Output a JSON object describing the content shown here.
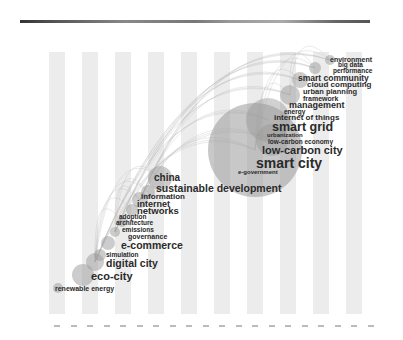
{
  "view": {
    "type": "keyword co-occurrence timezone map",
    "background": "#ffffff",
    "stripe_color": "#ececec",
    "node_color": "#9a9a9a",
    "link_color": "#b5b5b5",
    "text_color": "#2a2a2a"
  },
  "header": {
    "colorbar": {
      "colors": [
        "#333333",
        "#888888",
        "#777777",
        "#aaaaaa",
        "#555555"
      ]
    },
    "meta_lines": [
      "",
      "",
      "",
      "",
      "",
      "",
      ""
    ]
  },
  "timeline": {
    "slice_count": 20,
    "first_stripe_x": 49,
    "stripe_pitch": 33,
    "stripe_width": 16
  },
  "nodes": [
    {
      "cx": 255,
      "cy": 150,
      "r": 47,
      "opacity": 0.55
    },
    {
      "cx": 268,
      "cy": 120,
      "r": 22,
      "opacity": 0.45
    },
    {
      "cx": 272,
      "cy": 140,
      "r": 16,
      "opacity": 0.45
    },
    {
      "cx": 290,
      "cy": 95,
      "r": 10,
      "opacity": 0.5
    },
    {
      "cx": 300,
      "cy": 80,
      "r": 8,
      "opacity": 0.5
    },
    {
      "cx": 315,
      "cy": 68,
      "r": 6,
      "opacity": 0.5
    },
    {
      "cx": 330,
      "cy": 60,
      "r": 5,
      "opacity": 0.5
    },
    {
      "cx": 160,
      "cy": 178,
      "r": 12,
      "opacity": 0.5
    },
    {
      "cx": 148,
      "cy": 192,
      "r": 7,
      "opacity": 0.5
    },
    {
      "cx": 140,
      "cy": 200,
      "r": 8,
      "opacity": 0.5
    },
    {
      "cx": 132,
      "cy": 210,
      "r": 6,
      "opacity": 0.5
    },
    {
      "cx": 122,
      "cy": 222,
      "r": 5,
      "opacity": 0.5
    },
    {
      "cx": 115,
      "cy": 232,
      "r": 5,
      "opacity": 0.5
    },
    {
      "cx": 108,
      "cy": 243,
      "r": 7,
      "opacity": 0.5
    },
    {
      "cx": 100,
      "cy": 255,
      "r": 6,
      "opacity": 0.5
    },
    {
      "cx": 95,
      "cy": 262,
      "r": 9,
      "opacity": 0.5
    },
    {
      "cx": 83,
      "cy": 275,
      "r": 11,
      "opacity": 0.5
    },
    {
      "cx": 58,
      "cy": 288,
      "r": 5,
      "opacity": 0.5
    }
  ],
  "keywords": [
    {
      "label": "environment",
      "x": 330,
      "y": 56,
      "size": 7
    },
    {
      "label": "big data",
      "x": 338,
      "y": 62,
      "size": 6.5
    },
    {
      "label": "performance",
      "x": 333,
      "y": 68,
      "size": 6.5
    },
    {
      "label": "smart community",
      "x": 298,
      "y": 74,
      "size": 8.5
    },
    {
      "label": "cloud computing",
      "x": 307,
      "y": 81,
      "size": 8
    },
    {
      "label": "urban planning",
      "x": 303,
      "y": 88,
      "size": 7.5
    },
    {
      "label": "framework",
      "x": 303,
      "y": 95,
      "size": 7
    },
    {
      "label": "management",
      "x": 289,
      "y": 101,
      "size": 9
    },
    {
      "label": "energy",
      "x": 284,
      "y": 109,
      "size": 6.5
    },
    {
      "label": "internet of things",
      "x": 274,
      "y": 114,
      "size": 8
    },
    {
      "label": "smart grid",
      "x": 272,
      "y": 121,
      "size": 12.5
    },
    {
      "label": "urbanization",
      "x": 267,
      "y": 132,
      "size": 6
    },
    {
      "label": "low-carbon economy",
      "x": 268,
      "y": 139,
      "size": 6.5
    },
    {
      "label": "low-carbon city",
      "x": 262,
      "y": 145,
      "size": 11
    },
    {
      "label": "smart city",
      "x": 256,
      "y": 156,
      "size": 14
    },
    {
      "label": "e-government",
      "x": 238,
      "y": 169,
      "size": 6
    },
    {
      "label": "china",
      "x": 154,
      "y": 173,
      "size": 10
    },
    {
      "label": "sustainable development",
      "x": 156,
      "y": 183,
      "size": 10.5
    },
    {
      "label": "information",
      "x": 141,
      "y": 193,
      "size": 8
    },
    {
      "label": "internet",
      "x": 137,
      "y": 200,
      "size": 9
    },
    {
      "label": "networks",
      "x": 137,
      "y": 206,
      "size": 9.5
    },
    {
      "label": "adoption",
      "x": 119,
      "y": 214,
      "size": 6.5
    },
    {
      "label": "architecture",
      "x": 116,
      "y": 220,
      "size": 6.5
    },
    {
      "label": "emissions",
      "x": 122,
      "y": 227,
      "size": 6.5
    },
    {
      "label": "governance",
      "x": 128,
      "y": 233,
      "size": 7
    },
    {
      "label": "e-commerce",
      "x": 121,
      "y": 240,
      "size": 10.5
    },
    {
      "label": "simulation",
      "x": 106,
      "y": 252,
      "size": 6.5
    },
    {
      "label": "digital city",
      "x": 106,
      "y": 258,
      "size": 10.5
    },
    {
      "label": "eco-city",
      "x": 91,
      "y": 271,
      "size": 11
    },
    {
      "label": "renewable energy",
      "x": 55,
      "y": 285,
      "size": 7
    }
  ]
}
